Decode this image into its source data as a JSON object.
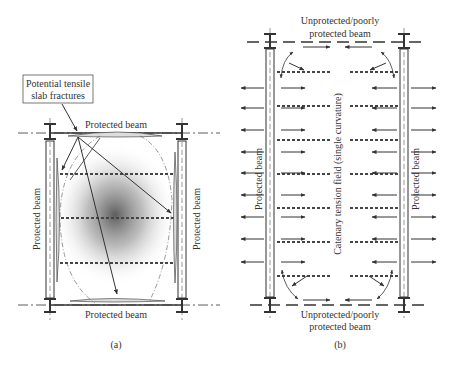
{
  "figure": {
    "panel_a": {
      "caption": "(a)",
      "callout_label_line1": "Potential tensile",
      "callout_label_line2": "slab fractures",
      "top_beam_label": "Protected beam",
      "bottom_beam_label": "Protected beam",
      "left_beam_label": "Protected beam",
      "right_beam_label": "Protected beam"
    },
    "panel_b": {
      "caption": "(b)",
      "top_beam_label_line1": "Unprotected/poorly",
      "top_beam_label_line2": "protected beam",
      "bottom_beam_label_line1": "Unprotected/poorly",
      "bottom_beam_label_line2": "protected beam",
      "left_beam_label": "Protected beam",
      "right_beam_label": "Protected beam",
      "center_label": "Catenary tension field (single curvature)"
    },
    "colors": {
      "line": "#333333",
      "shade": "#555555"
    }
  }
}
